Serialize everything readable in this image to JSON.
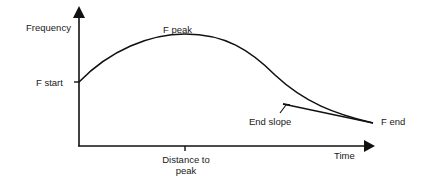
{
  "diagram": {
    "axes": {
      "y_label": "Frequency",
      "x_label": "Time"
    },
    "labels": {
      "f_start": "F start",
      "f_peak": "F peak",
      "f_end": "F end",
      "end_slope": "End slope",
      "distance_to_peak_line1": "Distance to",
      "distance_to_peak_line2": "peak"
    },
    "colors": {
      "line": "#111111",
      "background": "#ffffff"
    }
  }
}
